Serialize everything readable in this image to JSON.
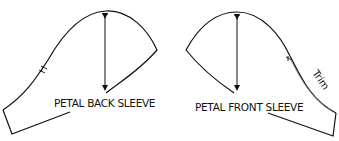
{
  "diagram": {
    "pieces": [
      {
        "name": "back-sleeve",
        "label": "PETAL BACK SLEEVE"
      },
      {
        "name": "front-sleeve",
        "label": "PETAL FRONT SLEEVE",
        "annotation": "Trim"
      }
    ],
    "colors": {
      "line": "#111111",
      "trim_line": "#888888",
      "background": "#ffffff"
    }
  }
}
